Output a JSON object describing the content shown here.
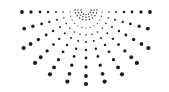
{
  "graphic": {
    "name": "half-sunburst-dots",
    "background": "#ffffff",
    "dot_color": "#1e1e1e",
    "center": {
      "x": 86,
      "y": 12
    },
    "rays": {
      "angles_deg": [
        0,
        15,
        30,
        45,
        60,
        75,
        90,
        105,
        120,
        135,
        150,
        165,
        180
      ],
      "distances": [
        16,
        23,
        30,
        38,
        46,
        55,
        64,
        72
      ],
      "max_radius_by_angle": {
        "0": 67,
        "180": 67,
        "15": 66,
        "165": 66,
        "default": 72
      },
      "min_dot_r": 0.6,
      "max_dot_r": 2.1
    },
    "arcs": {
      "radii": [
        5,
        8,
        11
      ],
      "dot_r": 0.7,
      "dots_per_arc": [
        7,
        9,
        11
      ]
    }
  }
}
